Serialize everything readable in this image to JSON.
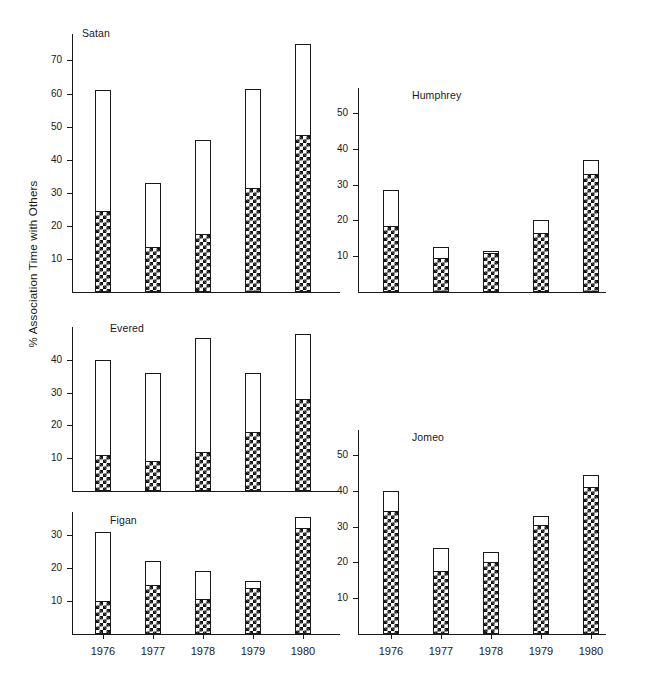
{
  "figure": {
    "ylabel": "% Association Time with Others",
    "x_categories": [
      "1976",
      "1977",
      "1978",
      "1979",
      "1980"
    ]
  },
  "panels": [
    {
      "id": "satan",
      "title": "Satan",
      "yticks": [
        "10",
        "20",
        "30",
        "40",
        "50",
        "60",
        "70"
      ],
      "ymax": 78
    },
    {
      "id": "humphrey",
      "title": "Humphrey",
      "yticks": [
        "10",
        "20",
        "30",
        "40",
        "50"
      ],
      "ymax": 57
    },
    {
      "id": "evered",
      "title": "Evered",
      "yticks": [
        "10",
        "20",
        "30",
        "40"
      ],
      "ymax": 50
    },
    {
      "id": "jomeo",
      "title": "Jomeo",
      "yticks": [
        "10",
        "20",
        "30",
        "40",
        "50"
      ],
      "ymax": 57
    },
    {
      "id": "figan",
      "title": "Figan",
      "yticks": [
        "10",
        "20",
        "30"
      ],
      "ymax": 37
    }
  ],
  "chart_data": {
    "type": "bar",
    "title": "",
    "subtitle": "",
    "xlabel": "",
    "ylabel": "% Association Time with Others",
    "categories": [
      "1976",
      "1977",
      "1978",
      "1979",
      "1980"
    ],
    "grid": false,
    "legend_position": "none",
    "note": "Five stacked-bar panels, one per chimpanzee. Each bar's total height is the overall % association time; the cross-hatched lower portion is a subset of that total, the open (white) upper portion is the remainder.",
    "series_names": [
      "hatched (lower segment)",
      "total (full bar height)"
    ],
    "panels": [
      {
        "name": "Satan",
        "ylim": [
          0,
          78
        ],
        "yticks": [
          10,
          20,
          30,
          40,
          50,
          60,
          70
        ],
        "total": [
          61,
          33,
          46,
          61.5,
          75
        ],
        "hatched": [
          24.5,
          13.5,
          17.5,
          31.5,
          47.5
        ],
        "open": [
          36.5,
          19.5,
          28.5,
          30,
          27.5
        ]
      },
      {
        "name": "Humphrey",
        "ylim": [
          0,
          57
        ],
        "yticks": [
          10,
          20,
          30,
          40,
          50
        ],
        "total": [
          28.5,
          12.5,
          11.5,
          20,
          37
        ],
        "hatched": [
          18.5,
          9.5,
          11,
          16.5,
          33
        ],
        "open": [
          10,
          3,
          0.5,
          3.5,
          4
        ]
      },
      {
        "name": "Evered",
        "ylim": [
          0,
          50
        ],
        "yticks": [
          10,
          20,
          30,
          40
        ],
        "total": [
          40,
          36,
          46.5,
          36,
          48
        ],
        "hatched": [
          11,
          9,
          12,
          18,
          28
        ],
        "open": [
          29,
          27,
          34.5,
          18,
          20
        ]
      },
      {
        "name": "Jomeo",
        "ylim": [
          0,
          57
        ],
        "yticks": [
          10,
          20,
          30,
          40,
          50
        ],
        "total": [
          40,
          24,
          23,
          33,
          44.5
        ],
        "hatched": [
          34.5,
          17.5,
          20,
          30.5,
          41
        ],
        "open": [
          5.5,
          6.5,
          3,
          2.5,
          3.5
        ]
      },
      {
        "name": "Figan",
        "ylim": [
          0,
          37
        ],
        "yticks": [
          10,
          20,
          30
        ],
        "total": [
          31,
          22,
          19,
          16,
          35.5
        ],
        "hatched": [
          10,
          15,
          10.5,
          14,
          32
        ],
        "open": [
          21,
          7,
          8.5,
          2,
          3.5
        ]
      }
    ]
  }
}
